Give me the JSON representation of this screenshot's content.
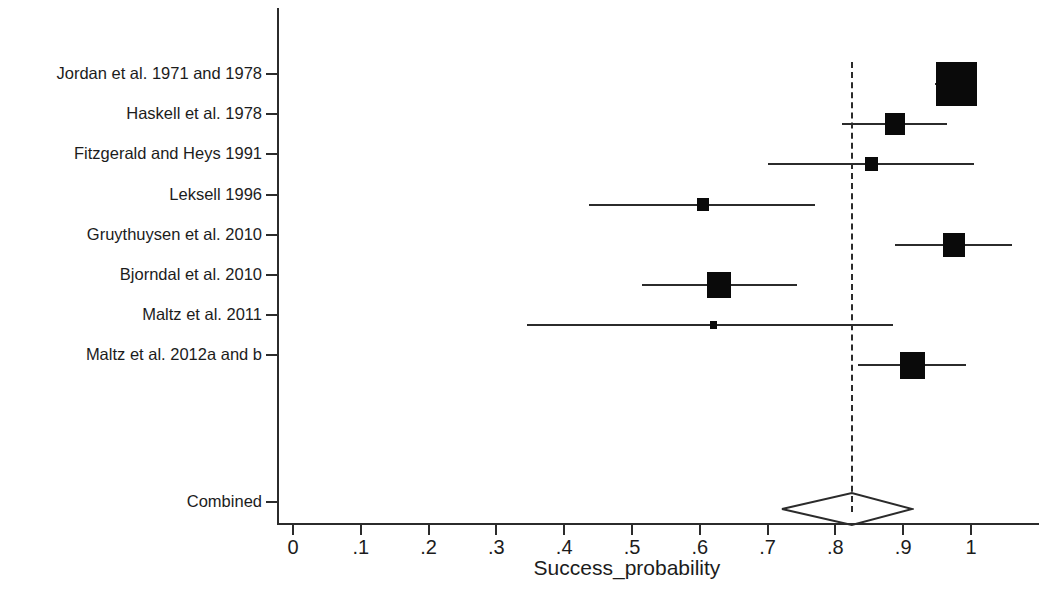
{
  "chart_data": {
    "type": "forest",
    "title": "",
    "xlabel": "Success_probability",
    "ylabel": "",
    "xlim": [
      0,
      1.06
    ],
    "grid": false,
    "legend": null,
    "reference_line": 0.824,
    "xticks": [
      0,
      0.1,
      0.2,
      0.3,
      0.4,
      0.5,
      0.6,
      0.7,
      0.8,
      0.9,
      1
    ],
    "xticklabels": [
      "0",
      ".1",
      ".2",
      ".3",
      ".4",
      ".5",
      ".6",
      ".7",
      ".8",
      ".9",
      "1"
    ],
    "categories": [
      "Jordan et al. 1971 and 1978",
      "Haskell et al. 1978",
      "Fitzgerald and Heys 1991",
      "Leksell 1996",
      "Gruythuysen et al. 2010",
      "Bjorndal et al. 2010",
      "Maltz et al. 2011",
      "Maltz et al. 2012a and b",
      "Combined"
    ],
    "studies": [
      {
        "label": "Jordan et al. 1971 and 1978",
        "estimate": 0.978,
        "ci_low": 0.947,
        "ci_high": 1.008,
        "weight_box_px": 41
      },
      {
        "label": "Haskell et al. 1978",
        "estimate": 0.888,
        "ci_low": 0.81,
        "ci_high": 0.965,
        "weight_box_px": 20
      },
      {
        "label": "Fitzgerald and Heys 1991",
        "estimate": 0.853,
        "ci_low": 0.7,
        "ci_high": 1.004,
        "weight_box_px": 13
      },
      {
        "label": "Leksell 1996",
        "estimate": 0.605,
        "ci_low": 0.437,
        "ci_high": 0.77,
        "weight_box_px": 12
      },
      {
        "label": "Gruythuysen et al. 2010",
        "estimate": 0.975,
        "ci_low": 0.888,
        "ci_high": 1.06,
        "weight_box_px": 22
      },
      {
        "label": "Bjorndal et al. 2010",
        "estimate": 0.628,
        "ci_low": 0.515,
        "ci_high": 0.743,
        "weight_box_px": 24
      },
      {
        "label": "Maltz et al. 2011",
        "estimate": 0.62,
        "ci_low": 0.345,
        "ci_high": 0.885,
        "weight_box_px": 7
      },
      {
        "label": "Maltz et al. 2012a and b",
        "estimate": 0.913,
        "ci_low": 0.833,
        "ci_high": 0.993,
        "weight_box_px": 25
      }
    ],
    "combined": {
      "label": "Combined",
      "estimate": 0.824,
      "ci_low": 0.721,
      "ci_high": 0.913
    }
  }
}
